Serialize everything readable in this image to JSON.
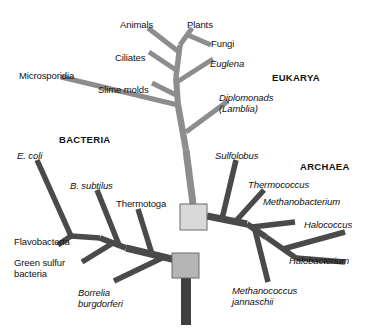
{
  "figure": {
    "background_color": "#ffffff"
  },
  "colors": {
    "eukarya_branch": "#8d8d8d",
    "bacteria_branch": "#4a4a4a",
    "archaea_branch": "#4a4a4a",
    "root_branch": "#3f3f3f",
    "node_upper_fill": "#d9d9d9",
    "node_lower_fill": "#b5b5b5",
    "node_stroke": "#6a6a6a",
    "text": "#111111"
  },
  "domains": [
    {
      "id": "bacteria",
      "label": "BACTERIA",
      "x": 59,
      "y": 134
    },
    {
      "id": "eukarya",
      "label": "EUKARYA",
      "x": 272,
      "y": 72
    },
    {
      "id": "archaea",
      "label": "ARCHAEA",
      "x": 300,
      "y": 161
    }
  ],
  "taxa": [
    {
      "id": "animals",
      "label": "Animals",
      "style": "roman",
      "x": 120,
      "y": 19,
      "align": "left"
    },
    {
      "id": "plants",
      "label": "Plants",
      "style": "roman",
      "x": 187,
      "y": 19,
      "align": "left"
    },
    {
      "id": "fungi",
      "label": "Fungi",
      "style": "roman",
      "x": 211,
      "y": 38,
      "align": "left"
    },
    {
      "id": "ciliates",
      "label": "Ciliates",
      "style": "roman",
      "x": 115,
      "y": 52,
      "align": "left"
    },
    {
      "id": "euglena",
      "label": "Euglena",
      "style": "italic",
      "x": 210,
      "y": 58,
      "align": "left"
    },
    {
      "id": "microsporidia",
      "label": "Microsporidia",
      "style": "roman",
      "x": 19,
      "y": 70,
      "align": "left"
    },
    {
      "id": "slime-molds",
      "label": "Slime molds",
      "style": "roman",
      "x": 98,
      "y": 84,
      "align": "left"
    },
    {
      "id": "diplomonads",
      "label": "Diplomonads\n(Lamblia)",
      "style": "italic",
      "x": 219,
      "y": 92,
      "align": "left"
    },
    {
      "id": "e-coli",
      "label": "E. coli",
      "style": "italic",
      "x": 17,
      "y": 150,
      "align": "left"
    },
    {
      "id": "sulfolobus",
      "label": "Sulfolobus",
      "style": "italic",
      "x": 215,
      "y": 150,
      "align": "left"
    },
    {
      "id": "b-subtilus",
      "label": "B. subtilus",
      "style": "italic",
      "x": 70,
      "y": 180,
      "align": "left"
    },
    {
      "id": "thermococcus",
      "label": "Thermococcus",
      "style": "italic",
      "x": 248,
      "y": 179,
      "align": "left"
    },
    {
      "id": "thermotoga",
      "label": "Thermotoga",
      "style": "roman",
      "x": 116,
      "y": 198,
      "align": "left"
    },
    {
      "id": "methanobacterium",
      "label": "Methanobacterium",
      "style": "italic",
      "x": 263,
      "y": 196,
      "align": "left"
    },
    {
      "id": "halococcus",
      "label": "Halococcus",
      "style": "italic",
      "x": 304,
      "y": 219,
      "align": "left"
    },
    {
      "id": "flavobacteria",
      "label": "Flavobacteria",
      "style": "roman",
      "x": 14,
      "y": 236,
      "align": "left"
    },
    {
      "id": "green-sulfur",
      "label": "Green sulfur\nbacteria",
      "style": "roman",
      "x": 14,
      "y": 257,
      "align": "left"
    },
    {
      "id": "halobacterium",
      "label": "Halobacterium",
      "style": "italic",
      "x": 289,
      "y": 255,
      "align": "left"
    },
    {
      "id": "borrelia",
      "label": "Borrelia\nburgdorferi",
      "style": "italic",
      "x": 78,
      "y": 287,
      "align": "left"
    },
    {
      "id": "methanococcus",
      "label": "Methanococcus\njannaschii",
      "style": "italic",
      "x": 232,
      "y": 285,
      "align": "left"
    }
  ],
  "nodes": [
    {
      "id": "node-upper",
      "x": 180,
      "y": 204,
      "width": 27,
      "height": 26
    },
    {
      "id": "node-lower",
      "x": 172,
      "y": 253,
      "width": 27,
      "height": 25
    }
  ],
  "branches": {
    "root": [
      {
        "id": "root-trunk",
        "x1": 186,
        "y1": 278,
        "x2": 186,
        "y2": 325,
        "width": 10,
        "group": "root"
      }
    ],
    "eukarya": [
      {
        "id": "euk-trunk-lower",
        "x1": 193,
        "y1": 204,
        "x2": 186,
        "y2": 150,
        "width": 7,
        "group": "eukarya"
      },
      {
        "id": "euk-trunk-mid",
        "x1": 186,
        "y1": 150,
        "x2": 178,
        "y2": 105,
        "width": 6.5,
        "group": "eukarya"
      },
      {
        "id": "euk-trunk-upper",
        "x1": 178,
        "y1": 105,
        "x2": 176,
        "y2": 77,
        "width": 6,
        "group": "eukarya"
      },
      {
        "id": "euk-trunk-top",
        "x1": 176,
        "y1": 77,
        "x2": 180,
        "y2": 45,
        "width": 5.5,
        "group": "eukarya"
      },
      {
        "id": "br-microsporidia",
        "x1": 178,
        "y1": 105,
        "x2": 61,
        "y2": 77,
        "width": 5,
        "group": "eukarya"
      },
      {
        "id": "br-diplomonads",
        "x1": 186,
        "y1": 132,
        "x2": 228,
        "y2": 101,
        "width": 5,
        "group": "eukarya"
      },
      {
        "id": "br-slime-molds",
        "x1": 178,
        "y1": 96,
        "x2": 152,
        "y2": 83,
        "width": 5,
        "group": "eukarya"
      },
      {
        "id": "br-euglena",
        "x1": 177,
        "y1": 82,
        "x2": 213,
        "y2": 59,
        "width": 5,
        "group": "eukarya"
      },
      {
        "id": "br-ciliates",
        "x1": 176,
        "y1": 70,
        "x2": 149,
        "y2": 52,
        "width": 5,
        "group": "eukarya"
      },
      {
        "id": "br-animals",
        "x1": 179,
        "y1": 52,
        "x2": 148,
        "y2": 28,
        "width": 5,
        "group": "eukarya"
      },
      {
        "id": "br-plants-fork",
        "x1": 180,
        "y1": 45,
        "x2": 192,
        "y2": 28,
        "width": 5,
        "group": "eukarya"
      },
      {
        "id": "br-fungi",
        "x1": 188,
        "y1": 35,
        "x2": 211,
        "y2": 45,
        "width": 5,
        "group": "eukarya"
      }
    ],
    "bacteria": [
      {
        "id": "bac-main",
        "x1": 176,
        "y1": 260,
        "x2": 126,
        "y2": 248,
        "width": 7,
        "group": "bacteria"
      },
      {
        "id": "br-thermotoga",
        "x1": 152,
        "y1": 254,
        "x2": 138,
        "y2": 209,
        "width": 5.5,
        "group": "bacteria"
      },
      {
        "id": "br-borrelia",
        "x1": 162,
        "y1": 258,
        "x2": 114,
        "y2": 281,
        "width": 5.5,
        "group": "bacteria"
      },
      {
        "id": "bac-branch-2",
        "x1": 126,
        "y1": 248,
        "x2": 100,
        "y2": 238,
        "width": 6,
        "group": "bacteria"
      },
      {
        "id": "br-b-subtilus",
        "x1": 119,
        "y1": 245,
        "x2": 97,
        "y2": 190,
        "width": 5.5,
        "group": "bacteria"
      },
      {
        "id": "br-green-sulfur",
        "x1": 113,
        "y1": 243,
        "x2": 82,
        "y2": 262,
        "width": 5.5,
        "group": "bacteria"
      },
      {
        "id": "bac-branch-3",
        "x1": 100,
        "y1": 238,
        "x2": 71,
        "y2": 236,
        "width": 5.5,
        "group": "bacteria"
      },
      {
        "id": "br-flavobacteria",
        "x1": 71,
        "y1": 236,
        "x2": 58,
        "y2": 245,
        "width": 5.5,
        "group": "bacteria"
      },
      {
        "id": "br-e-coli",
        "x1": 71,
        "y1": 236,
        "x2": 37,
        "y2": 160,
        "width": 5.5,
        "group": "bacteria"
      }
    ],
    "archaea": [
      {
        "id": "arc-main",
        "x1": 207,
        "y1": 216,
        "x2": 247,
        "y2": 224,
        "width": 7,
        "group": "archaea"
      },
      {
        "id": "br-sulfolobus",
        "x1": 222,
        "y1": 219,
        "x2": 236,
        "y2": 160,
        "width": 5.5,
        "group": "archaea"
      },
      {
        "id": "br-thermococcus",
        "x1": 235,
        "y1": 222,
        "x2": 264,
        "y2": 190,
        "width": 5.5,
        "group": "archaea"
      },
      {
        "id": "arc-branch-2",
        "x1": 247,
        "y1": 224,
        "x2": 266,
        "y2": 237,
        "width": 6,
        "group": "archaea"
      },
      {
        "id": "br-methanobacterium",
        "x1": 252,
        "y1": 227,
        "x2": 295,
        "y2": 222,
        "width": 5.5,
        "group": "archaea"
      },
      {
        "id": "br-methanococcus",
        "x1": 255,
        "y1": 230,
        "x2": 268,
        "y2": 282,
        "width": 5.5,
        "group": "archaea"
      },
      {
        "id": "arc-branch-3",
        "x1": 266,
        "y1": 237,
        "x2": 296,
        "y2": 258,
        "width": 5.5,
        "group": "archaea"
      },
      {
        "id": "br-halococcus",
        "x1": 283,
        "y1": 249,
        "x2": 345,
        "y2": 232,
        "width": 5.5,
        "group": "archaea"
      },
      {
        "id": "br-halobacterium",
        "x1": 296,
        "y1": 258,
        "x2": 345,
        "y2": 262,
        "width": 5.5,
        "group": "archaea"
      }
    ]
  }
}
